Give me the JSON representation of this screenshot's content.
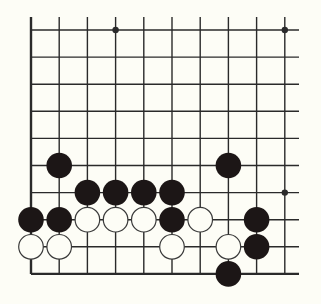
{
  "diagram": {
    "type": "go-board-fragment",
    "columns": 10,
    "rows": 10,
    "open_edges": [
      "top",
      "right"
    ],
    "closed_edges": [
      "left",
      "bottom"
    ],
    "colors": {
      "background": "#fdfdf6",
      "line": "#2a2a2a",
      "black_stone": "#1c1616",
      "white_stone_fill": "#fdfdf6",
      "white_stone_stroke": "#3a3a3a"
    },
    "star_points": [
      {
        "col": 3,
        "row": 0
      },
      {
        "col": 9,
        "row": 0
      },
      {
        "col": 9,
        "row": 6
      }
    ],
    "stones": [
      {
        "color": "black",
        "col": 1,
        "row": 5
      },
      {
        "color": "black",
        "col": 7,
        "row": 5
      },
      {
        "color": "black",
        "col": 2,
        "row": 6
      },
      {
        "color": "black",
        "col": 3,
        "row": 6
      },
      {
        "color": "black",
        "col": 4,
        "row": 6
      },
      {
        "color": "black",
        "col": 5,
        "row": 6
      },
      {
        "color": "black",
        "col": 0,
        "row": 7
      },
      {
        "color": "black",
        "col": 1,
        "row": 7
      },
      {
        "color": "white",
        "col": 2,
        "row": 7
      },
      {
        "color": "white",
        "col": 3,
        "row": 7
      },
      {
        "color": "white",
        "col": 4,
        "row": 7
      },
      {
        "color": "black",
        "col": 5,
        "row": 7
      },
      {
        "color": "white",
        "col": 6,
        "row": 7
      },
      {
        "color": "black",
        "col": 8,
        "row": 7
      },
      {
        "color": "white",
        "col": 0,
        "row": 8
      },
      {
        "color": "white",
        "col": 1,
        "row": 8
      },
      {
        "color": "white",
        "col": 5,
        "row": 8
      },
      {
        "color": "white",
        "col": 7,
        "row": 8
      },
      {
        "color": "black",
        "col": 8,
        "row": 8
      },
      {
        "color": "black",
        "col": 7,
        "row": 9
      }
    ]
  }
}
